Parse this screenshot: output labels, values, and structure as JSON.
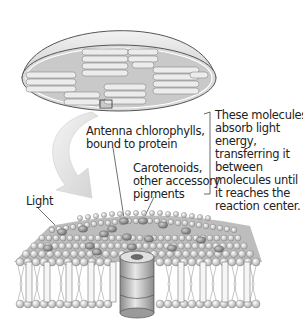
{
  "diagram": {
    "labels": {
      "antenna": [
        "Antenna chlorophylls,",
        "bound to protein"
      ],
      "carotenoids": [
        "Carotenoids,",
        "other accessory",
        "pigments"
      ],
      "note": [
        "These molecules",
        "absorb light",
        "energy,",
        "transferring it",
        "between",
        "molecules until",
        "it reaches the",
        "reaction center."
      ],
      "light": "Light"
    },
    "parts": [
      "chloroplast",
      "thylakoid-stacks",
      "zoom-box",
      "zoom-arrow",
      "thylakoid-membrane",
      "pigment-molecules",
      "reaction-center-protein",
      "lipid-bilayer",
      "bracket"
    ],
    "colors": {
      "outline": "#555555",
      "fill_light": "#e6e6e6",
      "fill_mid": "#c8c8c8",
      "fill_dark": "#999999",
      "arrow": "#dcdcdc",
      "text": "#222222"
    }
  }
}
